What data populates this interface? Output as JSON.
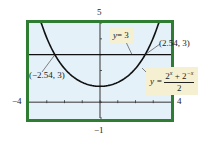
{
  "chart_data": {
    "type": "line",
    "title": "",
    "xlabel": "",
    "ylabel": "",
    "xlim": [
      -4,
      4
    ],
    "ylim": [
      -1,
      5
    ],
    "xticks": [
      -3,
      -2,
      -1,
      0,
      1,
      2,
      3
    ],
    "yticks": [
      0,
      1,
      2,
      3,
      4
    ],
    "window_labels": {
      "xmin": "−4",
      "xmax": "4",
      "ymin": "−1",
      "ymax": "5"
    },
    "grid": false,
    "series": [
      {
        "name": "y = (2^x + 2^-x)/2",
        "function": "(2^x + 2^-x)/2",
        "color": "#111111",
        "x": [
          -3.5,
          -3,
          -2.54,
          -2,
          -1,
          0,
          1,
          2,
          2.54,
          3,
          3.5
        ],
        "y": [
          5.7,
          4.06,
          3.0,
          2.125,
          1.25,
          1.0,
          1.25,
          2.125,
          3.0,
          4.06,
          5.7
        ]
      },
      {
        "name": "y = 3",
        "function": "3",
        "color": "#111111",
        "x": [
          -4,
          4
        ],
        "y": [
          3,
          3
        ]
      }
    ],
    "annotations": [
      {
        "text": "(−2.54, 3)",
        "x": -2.54,
        "y": 3
      },
      {
        "text": "(2.54, 3)",
        "x": 2.54,
        "y": 3
      },
      {
        "text": "y = 3",
        "type": "callout"
      },
      {
        "text": "y = (2^x + 2^−x)/2",
        "type": "callout"
      }
    ],
    "colors": {
      "frame": "#2e7d32",
      "plot_bg": "#e4f1f8",
      "callout_bg": "#f6f0d2"
    }
  },
  "labels": {
    "ymax": "5",
    "ymin": "−1",
    "xmin": "−4",
    "xmax": "4",
    "pt_left": "(−2.54, 3)",
    "pt_right": "(2.54, 3)",
    "line_eq_lhs": "y",
    "line_eq_rhs": "= 3",
    "curve_lhs": "y =",
    "curve_num_a": "2",
    "curve_exp_a": "x",
    "curve_plus": " + 2",
    "curve_exp_b": "−x",
    "curve_den": "2"
  }
}
